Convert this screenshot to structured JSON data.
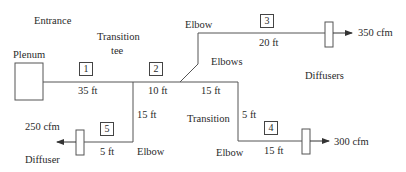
{
  "labels": {
    "entrance": "Entrance",
    "transition_tee": "Transition",
    "transition_tee_2": "tee",
    "plenum": "Plenum",
    "elbow_top": "Elbow",
    "elbows": "Elbows",
    "diffusers": "Diffusers",
    "transition": "Transition",
    "elbow_bottom_left": "Elbow",
    "elbow_bottom_right": "Elbow",
    "diffuser": "Diffuser"
  },
  "sections": [
    {
      "id": "1",
      "length": "35 ft"
    },
    {
      "id": "2",
      "length": "10 ft"
    },
    {
      "id": "3",
      "length": "20 ft"
    },
    {
      "id": "4",
      "length": "15 ft"
    },
    {
      "id": "5",
      "length": "5 ft"
    }
  ],
  "segments": {
    "branch_down_left": "15 ft",
    "main_after_tee": "15 ft",
    "branch_down_right": "5 ft"
  },
  "flows": {
    "outlet_3": "350 cfm",
    "outlet_4": "300 cfm",
    "outlet_5": "250 cfm"
  },
  "colors": {
    "line": "#555555",
    "text": "#2a2a2a"
  }
}
